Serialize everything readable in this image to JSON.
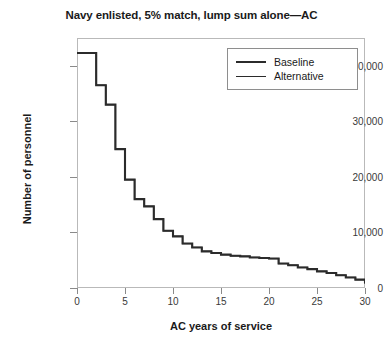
{
  "chart_data": {
    "type": "line",
    "title": "Navy enlisted, 5% match, lump sum alone—AC",
    "xlabel": "AC years of service",
    "ylabel": "Number of personnel",
    "xlim": [
      0,
      30
    ],
    "ylim": [
      0,
      45000
    ],
    "xticks": [
      0,
      5,
      10,
      15,
      20,
      25,
      30
    ],
    "xtick_labels": [
      "0",
      "5",
      "10",
      "15",
      "20",
      "25",
      "30"
    ],
    "yticks": [
      0,
      10000,
      20000,
      30000,
      40000
    ],
    "ytick_labels": [
      "0",
      "10,000",
      "20,000",
      "30,000",
      "40,000"
    ],
    "grid": false,
    "drawstyle": "steps-post",
    "legend_position": "upper right",
    "legend_entries": [
      "Baseline",
      "Alternative"
    ],
    "x": [
      0,
      1,
      2,
      3,
      4,
      5,
      6,
      7,
      8,
      9,
      10,
      11,
      12,
      13,
      14,
      15,
      16,
      17,
      18,
      19,
      20,
      21,
      22,
      23,
      24,
      25,
      26,
      27,
      28,
      29,
      30
    ],
    "series": [
      {
        "name": "Baseline",
        "values": [
          42300,
          42300,
          36500,
          33000,
          25000,
          19500,
          16000,
          14700,
          12400,
          10300,
          9300,
          8000,
          7300,
          6600,
          6300,
          6000,
          5800,
          5700,
          5500,
          5400,
          5300,
          4400,
          4100,
          3700,
          3400,
          3000,
          2700,
          2300,
          1900,
          1500,
          800
        ]
      },
      {
        "name": "Alternative",
        "values": [
          42300,
          42300,
          36500,
          33000,
          25000,
          19500,
          16000,
          14700,
          12400,
          10300,
          9300,
          8000,
          7300,
          6600,
          6300,
          6000,
          5800,
          5700,
          5500,
          5400,
          5300,
          4400,
          4100,
          3700,
          3400,
          3000,
          2700,
          2300,
          1900,
          1500,
          800
        ]
      }
    ],
    "colors": {
      "baseline_line": "#2b2b2b",
      "alternative_line": "#2b2b2b",
      "frame": "#b9b9b9",
      "tick": "#8a8a8a",
      "background": "#ffffff"
    }
  }
}
